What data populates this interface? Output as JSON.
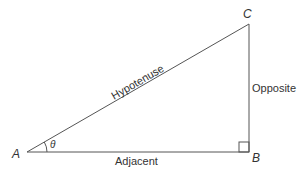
{
  "diagram": {
    "type": "right-triangle",
    "vertices": {
      "A": "A",
      "B": "B",
      "C": "C"
    },
    "angle_label": "θ",
    "sides": {
      "hypotenuse": "Hypotenuse",
      "opposite": "Opposite",
      "adjacent": "Adjacent"
    },
    "line_color": "#555555"
  }
}
